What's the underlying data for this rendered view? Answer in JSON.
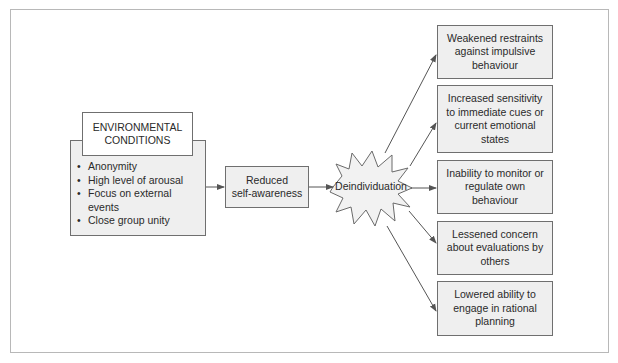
{
  "diagram": {
    "environmental_conditions": {
      "title_line1": "ENVIRONMENTAL",
      "title_line2": "CONDITIONS",
      "items": [
        "Anonymity",
        "High level of arousal",
        "Focus on external events",
        "Close group unity"
      ]
    },
    "reduced_self_awareness": {
      "line1": "Reduced",
      "line2": "self-awareness"
    },
    "deindividuation": {
      "label": "Deindividuation"
    },
    "outcomes": [
      {
        "lines": [
          "Weakened restraints",
          "against impulsive",
          "behaviour"
        ]
      },
      {
        "lines": [
          "Increased sensitivity",
          "to immediate cues or",
          "current emotional",
          "states"
        ]
      },
      {
        "lines": [
          "Inability to monitor or",
          "regulate own",
          "behaviour"
        ]
      },
      {
        "lines": [
          "Lessened concern",
          "about evaluations by",
          "others"
        ]
      },
      {
        "lines": [
          "Lowered ability to",
          "engage in rational",
          "planning"
        ]
      }
    ],
    "colors": {
      "box_fill": "#efefef",
      "box_border": "#6f6f6f",
      "arrow": "#555555",
      "frame": "#b8b8b8"
    }
  }
}
